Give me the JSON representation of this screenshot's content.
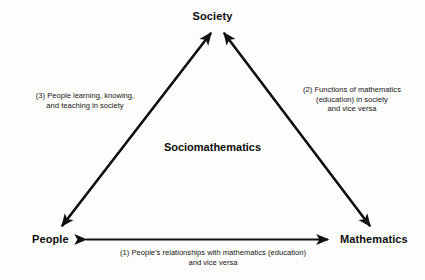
{
  "diagram": {
    "center_label": "Sociomathematics",
    "nodes": {
      "top": "Society",
      "bottom_left": "People",
      "bottom_right": "Mathematics"
    },
    "captions": {
      "left": "(3) People learning, knowing,\nand teaching in society",
      "right": "(2) Functions of mathematics\n(education) in society\nand vice versa",
      "bottom": "(1) People's relationships with mathematics (education)\nand vice versa"
    },
    "colors": {
      "ink": "#0d0d0d",
      "stroke": "#111111",
      "background": "#fdfdfc"
    }
  }
}
